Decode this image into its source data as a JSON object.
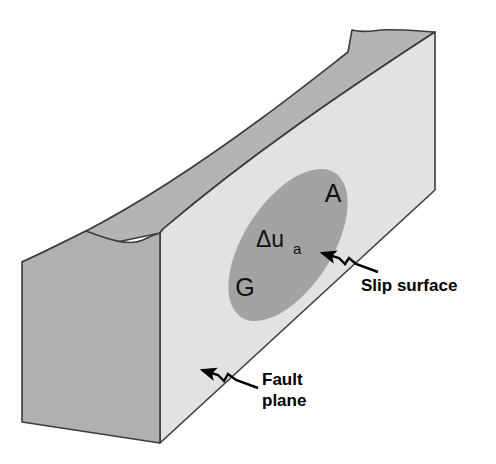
{
  "figure": {
    "background_color": "#ffffff",
    "width": 496,
    "height": 464
  },
  "colors": {
    "top_surface": "#b4b4b4",
    "end_face": "#b0b0b0",
    "fault_plane_face": "#e0e0e0",
    "slip_ellipse": "#a0a0a0",
    "outline": "#3c3c3c",
    "text": "#000000"
  },
  "block": {
    "top_surface_name": "top-surface",
    "end_face_name": "left-end-face",
    "front_face_name": "fault-plane-face"
  },
  "slip_surface": {
    "asperity_label": "A",
    "ground_label": "G",
    "slip_label_delta": "Δu",
    "slip_label_subscript": "a"
  },
  "callouts": [
    {
      "id": "slip-surface-callout",
      "label": "Slip surface",
      "lines": [
        "Slip surface"
      ]
    },
    {
      "id": "fault-plane-callout",
      "label": "Fault plane",
      "lines": [
        "Fault",
        "plane"
      ]
    }
  ]
}
